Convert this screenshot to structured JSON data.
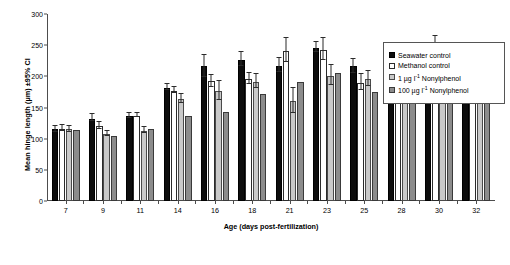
{
  "chart_data": {
    "type": "bar",
    "title": "",
    "xlabel": "Age (days post-fertilization)",
    "ylabel": "Mean hinge length (µm) ±95% CI",
    "ylim": [
      0,
      300
    ],
    "yticks": [
      0,
      50,
      100,
      150,
      200,
      250,
      300
    ],
    "grid": false,
    "legend_position": "right",
    "categories": [
      "7",
      "9",
      "11",
      "14",
      "16",
      "18",
      "21",
      "23",
      "25",
      "28",
      "30",
      "32"
    ],
    "series": [
      {
        "name": "Seawater control",
        "color": "#0d0d0d",
        "values": [
          115,
          132,
          136,
          182,
          216,
          227,
          217,
          246,
          216,
          213,
          238,
          224
        ],
        "err_low": [
          109,
          126,
          131,
          177,
          198,
          215,
          205,
          237,
          204,
          204,
          224,
          209
        ],
        "err_high": [
          121,
          139,
          141,
          188,
          234,
          239,
          229,
          255,
          228,
          222,
          252,
          239
        ]
      },
      {
        "name": "Methanol control",
        "color": "#ffffff",
        "values": [
          116,
          120,
          137,
          177,
          192,
          196,
          241,
          243,
          190,
          224,
          250,
          223
        ],
        "err_low": [
          110,
          114,
          133,
          171,
          182,
          186,
          221,
          224,
          177,
          214,
          236,
          208
        ],
        "err_high": [
          122,
          126,
          141,
          183,
          202,
          206,
          261,
          262,
          203,
          234,
          264,
          238
        ]
      },
      {
        "name": "1 µg l⁻¹ Nonylphenol",
        "color": "#c9c9c9",
        "values": [
          115,
          107,
          113,
          163,
          177,
          191,
          161,
          201,
          196,
          208,
          192,
          178
        ],
        "err_low": [
          109,
          102,
          108,
          155,
          161,
          179,
          140,
          184,
          183,
          195,
          175,
          163
        ],
        "err_high": [
          121,
          112,
          118,
          171,
          193,
          203,
          182,
          218,
          209,
          221,
          209,
          193
        ]
      },
      {
        "name": "100 µg l⁻¹ Nonylphenol",
        "color": "#8c8c8c",
        "values": [
          114,
          104,
          116,
          137,
          143,
          171,
          191,
          206,
          175,
          222,
          201,
          188
        ]
      }
    ]
  },
  "axes": {
    "y_ticks": [
      "0",
      "50",
      "100",
      "150",
      "200",
      "250",
      "300"
    ],
    "x_ticks": [
      "7",
      "9",
      "11",
      "14",
      "16",
      "18",
      "21",
      "23",
      "25",
      "28",
      "30",
      "32"
    ],
    "x_title": "Age (days post-fertilization)",
    "y_title": "Mean hinge length (µm) ±95% CI"
  },
  "legend": {
    "items": [
      {
        "label": "Seawater control",
        "style": "solid-black"
      },
      {
        "label": "Methanol control",
        "style": "open-white"
      },
      {
        "label_prefix": "1 µg l",
        "label_sup": "-1",
        "label_suffix": " Nonylphenol",
        "style": "light-gray"
      },
      {
        "label_prefix": "100 µg l",
        "label_sup": "-1",
        "label_suffix": " Nonylphenol",
        "style": "mid-gray"
      }
    ]
  }
}
